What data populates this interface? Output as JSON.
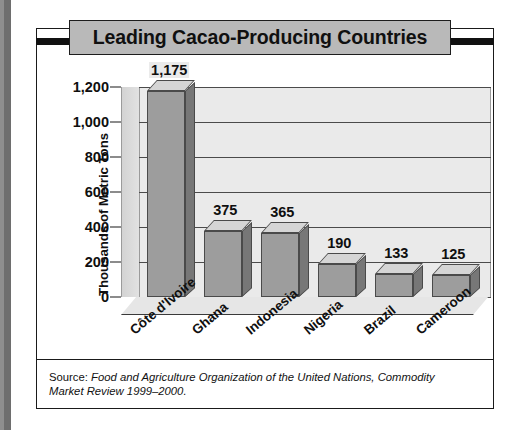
{
  "figure": {
    "title": "Leading Cacao-Producing Countries",
    "source_label": "Source:",
    "source_text": "Food and Agriculture Organization of the United Nations, Commodity Market Review 1999–2000."
  },
  "colors": {
    "banner_fill": "#b9b9b9",
    "frame_line": "#1a1a1a",
    "plot_background": "#eaeaea",
    "bar_front": "#9d9d9d",
    "bar_top": "#d5d5d5",
    "bar_side": "#777777",
    "gridline": "#4b4b4b",
    "gutter": "#6e6e6e"
  },
  "chart_data": {
    "type": "bar",
    "title": "Leading Cacao-Producing Countries",
    "xlabel": "",
    "ylabel": "Thousands of Metric Tons",
    "categories": [
      "Côte d'Ivoire",
      "Ghana",
      "Indonesia",
      "Nigeria",
      "Brazil",
      "Cameroon"
    ],
    "values": [
      1175,
      375,
      365,
      190,
      133,
      125
    ],
    "value_labels": [
      "1,175",
      "375",
      "365",
      "190",
      "133",
      "125"
    ],
    "ylim": [
      0,
      1200
    ],
    "yticks": [
      0,
      200,
      400,
      600,
      800,
      1000,
      1200
    ],
    "ytick_labels": [
      "0",
      "200",
      "400",
      "600",
      "800",
      "1,000",
      "1,200"
    ],
    "grid": true,
    "legend": false,
    "style_3d": true
  }
}
